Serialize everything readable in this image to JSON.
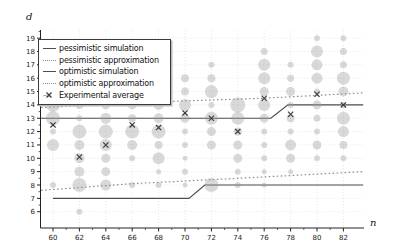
{
  "figure": {
    "ylabel": "d",
    "xlabel": "n"
  },
  "legend": {
    "entries": [
      {
        "label": "pessimistic simulation",
        "marker": "solid-line",
        "color": "#4d4d4d"
      },
      {
        "label": "pessimistic approximation",
        "marker": "dotted-line",
        "color": "#8e8e8e"
      },
      {
        "label": "optimistic simulation",
        "marker": "solid-line",
        "color": "#4d4d4d"
      },
      {
        "label": "optimistic approximation",
        "marker": "dotted-line",
        "color": "#8e8e8e"
      },
      {
        "label": "Experimental average",
        "marker": "x-marker",
        "color": "#3c3c3c"
      }
    ]
  },
  "colors": {
    "bubble_fill": "#9a9a9a",
    "bubble_opacity": 0.38,
    "axis": "#222222",
    "grid": "#dcdcdc",
    "solid_line": "#4d4d4d",
    "dotted_line": "#8e8e8e",
    "x_marker": "#3c3c3c"
  },
  "chart_data": {
    "type": "scatter",
    "title": "",
    "xlabel": "n",
    "ylabel": "d",
    "xlim": [
      59,
      84
    ],
    "ylim": [
      5,
      19.6
    ],
    "x_ticks_major": [
      60,
      62,
      64,
      66,
      68,
      70,
      72,
      74,
      76,
      78,
      80,
      82
    ],
    "y_ticks_major": [
      6,
      7,
      8,
      9,
      10,
      11,
      12,
      13,
      14,
      15,
      16,
      17,
      18,
      19
    ],
    "grid": true,
    "legend_position": "upper-left",
    "bubbles": [
      {
        "n": 60,
        "d": 14,
        "r": 7
      },
      {
        "n": 60,
        "d": 13,
        "r": 7
      },
      {
        "n": 60,
        "d": 12,
        "r": 3
      },
      {
        "n": 60,
        "d": 11,
        "r": 6
      },
      {
        "n": 60,
        "d": 8,
        "r": 3
      },
      {
        "n": 62,
        "d": 14,
        "r": 4
      },
      {
        "n": 62,
        "d": 13,
        "r": 3
      },
      {
        "n": 62,
        "d": 12,
        "r": 7
      },
      {
        "n": 62,
        "d": 11,
        "r": 5
      },
      {
        "n": 62,
        "d": 10,
        "r": 5
      },
      {
        "n": 62,
        "d": 9,
        "r": 5
      },
      {
        "n": 62,
        "d": 8,
        "r": 7
      },
      {
        "n": 62,
        "d": 6,
        "r": 3
      },
      {
        "n": 64,
        "d": 14,
        "r": 4.5
      },
      {
        "n": 64,
        "d": 13,
        "r": 5.5
      },
      {
        "n": 64,
        "d": 12,
        "r": 7
      },
      {
        "n": 64,
        "d": 11,
        "r": 6
      },
      {
        "n": 64,
        "d": 10,
        "r": 4.5
      },
      {
        "n": 64,
        "d": 9,
        "r": 4.5
      },
      {
        "n": 64,
        "d": 8,
        "r": 5.5
      },
      {
        "n": 66,
        "d": 14,
        "r": 4.5
      },
      {
        "n": 66,
        "d": 13,
        "r": 4
      },
      {
        "n": 66,
        "d": 12,
        "r": 7
      },
      {
        "n": 66,
        "d": 11,
        "r": 5
      },
      {
        "n": 66,
        "d": 10,
        "r": 3
      },
      {
        "n": 66,
        "d": 8,
        "r": 3
      },
      {
        "n": 68,
        "d": 14,
        "r": 5
      },
      {
        "n": 68,
        "d": 13,
        "r": 5
      },
      {
        "n": 68,
        "d": 12,
        "r": 7
      },
      {
        "n": 68,
        "d": 11,
        "r": 4
      },
      {
        "n": 68,
        "d": 10,
        "r": 6
      },
      {
        "n": 68,
        "d": 9,
        "r": 2.5
      },
      {
        "n": 68,
        "d": 8,
        "r": 3
      },
      {
        "n": 70,
        "d": 16,
        "r": 4
      },
      {
        "n": 70,
        "d": 15,
        "r": 4
      },
      {
        "n": 70,
        "d": 14,
        "r": 6
      },
      {
        "n": 70,
        "d": 13,
        "r": 4.5
      },
      {
        "n": 70,
        "d": 12,
        "r": 3
      },
      {
        "n": 70,
        "d": 11,
        "r": 3
      },
      {
        "n": 70,
        "d": 10,
        "r": 2.5
      },
      {
        "n": 70,
        "d": 9,
        "r": 3
      },
      {
        "n": 70,
        "d": 8,
        "r": 2.5
      },
      {
        "n": 72,
        "d": 17,
        "r": 3
      },
      {
        "n": 72,
        "d": 16,
        "r": 4
      },
      {
        "n": 72,
        "d": 15,
        "r": 6.5
      },
      {
        "n": 72,
        "d": 14,
        "r": 3
      },
      {
        "n": 72,
        "d": 13,
        "r": 6.5
      },
      {
        "n": 72,
        "d": 12,
        "r": 4.5
      },
      {
        "n": 72,
        "d": 11,
        "r": 4.5
      },
      {
        "n": 72,
        "d": 8,
        "r": 7
      },
      {
        "n": 74,
        "d": 14,
        "r": 7.5
      },
      {
        "n": 74,
        "d": 13,
        "r": 6.5
      },
      {
        "n": 74,
        "d": 12,
        "r": 4
      },
      {
        "n": 74,
        "d": 11,
        "r": 4.5
      },
      {
        "n": 74,
        "d": 10,
        "r": 4.5
      },
      {
        "n": 74,
        "d": 9,
        "r": 3
      },
      {
        "n": 74,
        "d": 8,
        "r": 3
      },
      {
        "n": 76,
        "d": 18,
        "r": 3.5
      },
      {
        "n": 76,
        "d": 17,
        "r": 6
      },
      {
        "n": 76,
        "d": 16,
        "r": 6
      },
      {
        "n": 76,
        "d": 15,
        "r": 4.5
      },
      {
        "n": 76,
        "d": 14,
        "r": 6
      },
      {
        "n": 76,
        "d": 13,
        "r": 4.5
      },
      {
        "n": 76,
        "d": 12,
        "r": 3
      },
      {
        "n": 76,
        "d": 11,
        "r": 3
      },
      {
        "n": 76,
        "d": 10,
        "r": 3
      },
      {
        "n": 76,
        "d": 9,
        "r": 2.5
      },
      {
        "n": 76,
        "d": 8,
        "r": 2.5
      },
      {
        "n": 78,
        "d": 17,
        "r": 3
      },
      {
        "n": 78,
        "d": 16,
        "r": 3.5
      },
      {
        "n": 78,
        "d": 15,
        "r": 4.5
      },
      {
        "n": 78,
        "d": 14,
        "r": 3
      },
      {
        "n": 78,
        "d": 13,
        "r": 4
      },
      {
        "n": 78,
        "d": 12,
        "r": 3
      },
      {
        "n": 78,
        "d": 11,
        "r": 5.5
      },
      {
        "n": 78,
        "d": 10,
        "r": 4.5
      },
      {
        "n": 78,
        "d": 9,
        "r": 2.5
      },
      {
        "n": 80,
        "d": 19,
        "r": 3
      },
      {
        "n": 80,
        "d": 18,
        "r": 6
      },
      {
        "n": 80,
        "d": 17,
        "r": 5.5
      },
      {
        "n": 80,
        "d": 16,
        "r": 5.5
      },
      {
        "n": 80,
        "d": 15,
        "r": 3
      },
      {
        "n": 80,
        "d": 14,
        "r": 4.5
      },
      {
        "n": 80,
        "d": 13,
        "r": 3.5
      },
      {
        "n": 80,
        "d": 12,
        "r": 3
      },
      {
        "n": 80,
        "d": 11,
        "r": 4.5
      },
      {
        "n": 80,
        "d": 10,
        "r": 3
      },
      {
        "n": 82,
        "d": 19,
        "r": 3
      },
      {
        "n": 82,
        "d": 18,
        "r": 3.5
      },
      {
        "n": 82,
        "d": 17,
        "r": 3.5
      },
      {
        "n": 82,
        "d": 16,
        "r": 6.5
      },
      {
        "n": 82,
        "d": 15,
        "r": 5
      },
      {
        "n": 82,
        "d": 14,
        "r": 3
      },
      {
        "n": 82,
        "d": 13,
        "r": 6.5
      },
      {
        "n": 82,
        "d": 12,
        "r": 5.5
      },
      {
        "n": 82,
        "d": 11,
        "r": 4
      },
      {
        "n": 82,
        "d": 10,
        "r": 3
      }
    ],
    "experimental_average": [
      {
        "n": 60,
        "d": 12.5
      },
      {
        "n": 62,
        "d": 10.1
      },
      {
        "n": 64,
        "d": 11
      },
      {
        "n": 66,
        "d": 12.5
      },
      {
        "n": 68,
        "d": 12.3
      },
      {
        "n": 70,
        "d": 13.4
      },
      {
        "n": 72,
        "d": 13
      },
      {
        "n": 74,
        "d": 12
      },
      {
        "n": 76,
        "d": 14.5
      },
      {
        "n": 78,
        "d": 13.3
      },
      {
        "n": 80,
        "d": 14.8
      },
      {
        "n": 82,
        "d": 14
      }
    ],
    "lines": [
      {
        "name": "pessimistic-simulation",
        "style": "solid",
        "points": [
          [
            59.1,
            13
          ],
          [
            76.5,
            13
          ],
          [
            77.8,
            14
          ],
          [
            83.5,
            14
          ]
        ]
      },
      {
        "name": "pessimistic-approximation",
        "style": "dotted",
        "points": [
          [
            59.1,
            13.8
          ],
          [
            70,
            14.3
          ],
          [
            76,
            14.5
          ],
          [
            83.5,
            14.9
          ]
        ]
      },
      {
        "name": "optimistic-simulation",
        "style": "solid",
        "points": [
          [
            60,
            7
          ],
          [
            70.3,
            7
          ],
          [
            71.5,
            8
          ],
          [
            83.5,
            8
          ]
        ]
      },
      {
        "name": "optimistic-approximation",
        "style": "dotted",
        "points": [
          [
            59.1,
            7.6
          ],
          [
            66,
            8.1
          ],
          [
            74,
            8.5
          ],
          [
            83.5,
            9
          ]
        ]
      }
    ]
  }
}
